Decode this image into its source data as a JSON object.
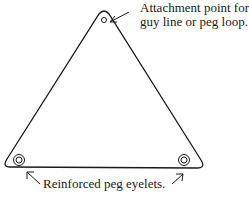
{
  "diagram": {
    "type": "tarp-shelter-triangle",
    "annotations": {
      "top": {
        "line1": "Attachment point for",
        "line2": "guy line or peg loop."
      },
      "bottom": "Reinforced peg eyelets."
    },
    "colors": {
      "stroke": "#1a1a1a",
      "background": "#ffffff"
    }
  }
}
